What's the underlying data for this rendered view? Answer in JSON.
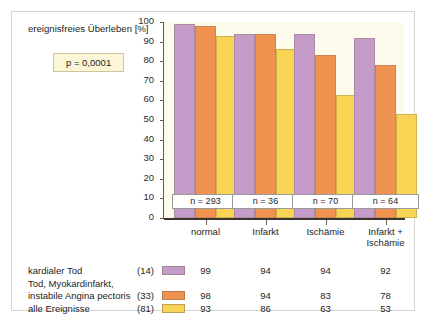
{
  "chart_data": {
    "type": "bar",
    "title": "ereignisfreies Überleben [%]",
    "xlabel": "",
    "ylabel": "ereignisfreies Überleben [%]",
    "ylim": [
      0,
      100
    ],
    "ytick_step": 10,
    "yticks": [
      "100",
      "90",
      "80",
      "70",
      "60",
      "50",
      "40",
      "30",
      "20",
      "10",
      "0"
    ],
    "grid": false,
    "legend_position": "bottom-table",
    "annotation": "p = 0,0001",
    "categories": [
      "normal",
      "Infarkt",
      "Ischämie",
      "Infarkt +\nIschämie"
    ],
    "category_lines": [
      [
        "normal"
      ],
      [
        "Infarkt"
      ],
      [
        "Ischämie"
      ],
      [
        "Infarkt +",
        "Ischämie"
      ]
    ],
    "group_counts": [
      "n = 293",
      "n = 36",
      "n = 70",
      "n = 64"
    ],
    "series": [
      {
        "name": "kardialer Tod",
        "name_lines": [
          "kardialer Tod"
        ],
        "count": "(14)",
        "color": "#c49bc9",
        "values": [
          99,
          94,
          94,
          92
        ]
      },
      {
        "name": "Tod, Myokardinfarkt, instabile Angina pectoris",
        "name_lines": [
          "Tod, Myokardinfarkt,",
          "instabile Angina pectoris"
        ],
        "count": "(33)",
        "color": "#f09250",
        "values": [
          98,
          94,
          83,
          78
        ]
      },
      {
        "name": "alle Ereignisse",
        "name_lines": [
          "alle Ereignisse"
        ],
        "count": "(81)",
        "color": "#f8d455",
        "values": [
          93,
          86,
          63,
          53
        ]
      }
    ]
  },
  "colors": {
    "plot_background": "#fdfbec",
    "figure_background": "#ffffff",
    "frame_border": "#d4d4d4",
    "axis": "#3a332c",
    "pvalue_fill": "#fbf6d8",
    "pvalue_border": "#cfc596",
    "nbox_fill": "#ffffff",
    "nbox_border": "#9a9a9a"
  }
}
